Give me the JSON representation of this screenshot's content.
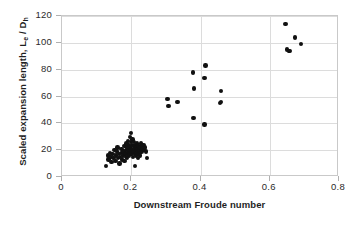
{
  "chart_data": {
    "type": "scatter",
    "title": "",
    "xlabel": "Downstream Froude number",
    "ylabel": "Scaled expansion length, Le / Dh",
    "ylabel_parts": {
      "main": "Scaled expansion length, L",
      "sub1": "e",
      "mid": " / D",
      "sub2": "h"
    },
    "xlim": [
      0,
      0.8
    ],
    "ylim": [
      0,
      120
    ],
    "xticks": [
      "0",
      "0.2",
      "0.4",
      "0.6",
      "0.8"
    ],
    "xtick_values": [
      0,
      0.2,
      0.4,
      0.6,
      0.8
    ],
    "yticks": [
      "0",
      "20",
      "40",
      "60",
      "80",
      "100",
      "120"
    ],
    "ytick_values": [
      0,
      20,
      40,
      60,
      80,
      100,
      120
    ],
    "grid": "horizontal-and-vertical",
    "legend": "none",
    "marker": "filled-circle",
    "marker_color": "#111111",
    "series": [
      {
        "name": "Scaled expansion length vs downstream Froude number",
        "points": [
          [
            0.127,
            8
          ],
          [
            0.132,
            16
          ],
          [
            0.134,
            13
          ],
          [
            0.138,
            18
          ],
          [
            0.14,
            15
          ],
          [
            0.143,
            11
          ],
          [
            0.146,
            17
          ],
          [
            0.149,
            14
          ],
          [
            0.152,
            20
          ],
          [
            0.154,
            12
          ],
          [
            0.156,
            16
          ],
          [
            0.158,
            19
          ],
          [
            0.16,
            22
          ],
          [
            0.162,
            14
          ],
          [
            0.164,
            17
          ],
          [
            0.166,
            10
          ],
          [
            0.168,
            15
          ],
          [
            0.17,
            18
          ],
          [
            0.172,
            21
          ],
          [
            0.174,
            13
          ],
          [
            0.176,
            16
          ],
          [
            0.178,
            19
          ],
          [
            0.18,
            23
          ],
          [
            0.181,
            12
          ],
          [
            0.183,
            17
          ],
          [
            0.184,
            20
          ],
          [
            0.185,
            15
          ],
          [
            0.186,
            25
          ],
          [
            0.187,
            18
          ],
          [
            0.188,
            14
          ],
          [
            0.189,
            22
          ],
          [
            0.19,
            17
          ],
          [
            0.191,
            27
          ],
          [
            0.192,
            20
          ],
          [
            0.193,
            16
          ],
          [
            0.194,
            24
          ],
          [
            0.195,
            19
          ],
          [
            0.196,
            30
          ],
          [
            0.197,
            22
          ],
          [
            0.198,
            18
          ],
          [
            0.199,
            26
          ],
          [
            0.2,
            21
          ],
          [
            0.2,
            33
          ],
          [
            0.201,
            17
          ],
          [
            0.202,
            24
          ],
          [
            0.203,
            20
          ],
          [
            0.204,
            28
          ],
          [
            0.205,
            15
          ],
          [
            0.206,
            23
          ],
          [
            0.207,
            19
          ],
          [
            0.208,
            26
          ],
          [
            0.209,
            21
          ],
          [
            0.21,
            17
          ],
          [
            0.211,
            8
          ],
          [
            0.212,
            24
          ],
          [
            0.213,
            20
          ],
          [
            0.214,
            16
          ],
          [
            0.215,
            22
          ],
          [
            0.216,
            18
          ],
          [
            0.217,
            25
          ],
          [
            0.218,
            21
          ],
          [
            0.219,
            14
          ],
          [
            0.22,
            19
          ],
          [
            0.221,
            23
          ],
          [
            0.222,
            17
          ],
          [
            0.223,
            20
          ],
          [
            0.225,
            16
          ],
          [
            0.226,
            22
          ],
          [
            0.228,
            25
          ],
          [
            0.23,
            19
          ],
          [
            0.231,
            23
          ],
          [
            0.233,
            21
          ],
          [
            0.235,
            24
          ],
          [
            0.237,
            20
          ],
          [
            0.24,
            22
          ],
          [
            0.243,
            19
          ],
          [
            0.246,
            14
          ],
          [
            0.305,
            58
          ],
          [
            0.307,
            53
          ],
          [
            0.333,
            56
          ],
          [
            0.378,
            78
          ],
          [
            0.381,
            66
          ],
          [
            0.38,
            44
          ],
          [
            0.414,
            83
          ],
          [
            0.412,
            74
          ],
          [
            0.411,
            39
          ],
          [
            0.459,
            64
          ],
          [
            0.457,
            55
          ],
          [
            0.459,
            56
          ],
          [
            0.645,
            114
          ],
          [
            0.65,
            95
          ],
          [
            0.655,
            94
          ],
          [
            0.657,
            94
          ],
          [
            0.673,
            104
          ],
          [
            0.691,
            99
          ]
        ]
      }
    ]
  }
}
